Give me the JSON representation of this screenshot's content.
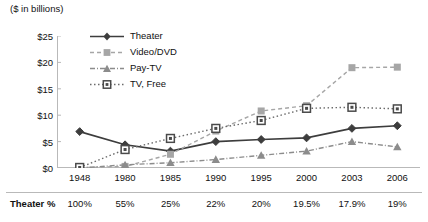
{
  "chart_data": {
    "type": "line",
    "title": "($ in billions)",
    "xlabel": "",
    "ylabel": "",
    "ylim": [
      0,
      25
    ],
    "ytick_step": 5,
    "ytick_labels": [
      "$0",
      "$5",
      "$10",
      "$15",
      "$20",
      "$25"
    ],
    "ytick_values": [
      0,
      5,
      10,
      15,
      20,
      25
    ],
    "grid": false,
    "legend_position": "inside-top-left",
    "categories": [
      "1948",
      "1980",
      "1985",
      "1990",
      "1995",
      "2000",
      "2003",
      "2006"
    ],
    "series": [
      {
        "name": "Theater",
        "marker": "diamond",
        "dash": "solid",
        "color": "#3d3d3d",
        "values": [
          6.9,
          4.4,
          3.2,
          5.0,
          5.4,
          5.7,
          7.5,
          8.0
        ]
      },
      {
        "name": "Video/DVD",
        "marker": "square",
        "dash": "dashed",
        "color": "#a6a6a6",
        "values": [
          0.05,
          0.3,
          2.6,
          7.0,
          10.8,
          11.8,
          19.0,
          19.1
        ]
      },
      {
        "name": "Pay-TV",
        "marker": "triangle",
        "dash": "dash-dot",
        "color": "#8c8c8c",
        "values": [
          0.0,
          0.6,
          1.0,
          1.6,
          2.4,
          3.2,
          5.0,
          4.0
        ]
      },
      {
        "name": "TV, Free",
        "marker": "square-dot",
        "dash": "dotted",
        "color": "#6b6b6b",
        "values": [
          0.1,
          3.5,
          5.6,
          7.5,
          9.0,
          11.3,
          11.5,
          11.2
        ]
      }
    ]
  },
  "table": {
    "row_label": "Theater %",
    "years": [
      "1948",
      "1980",
      "1985",
      "1990",
      "1995",
      "2000",
      "2003",
      "2006"
    ],
    "theater_pct": [
      "100%",
      "55%",
      "25%",
      "22%",
      "20%",
      "19.5%",
      "17.9%",
      "19%"
    ]
  },
  "legend": {
    "items": [
      {
        "label": "Theater"
      },
      {
        "label": "Video/DVD"
      },
      {
        "label": "Pay-TV"
      },
      {
        "label": "TV, Free"
      }
    ]
  }
}
